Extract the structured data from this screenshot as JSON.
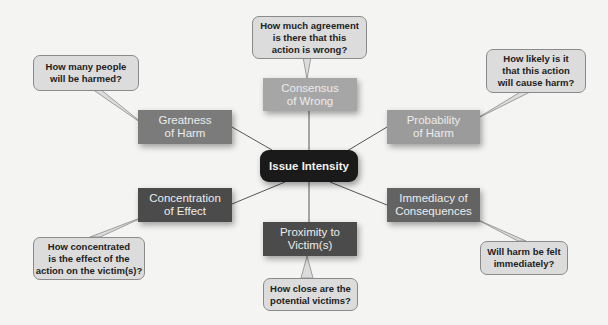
{
  "diagram": {
    "center": {
      "label": "Issue Intensity",
      "color": "#1a1a1a"
    },
    "factors": [
      {
        "id": "consensus",
        "label": "Consensus\nof Wrong",
        "color": "#a6a6a6",
        "question": "How much agreement\nis there that this\naction is wrong?"
      },
      {
        "id": "greatness",
        "label": "Greatness\nof Harm",
        "color": "#7b7b7b",
        "question": "How many people\nwill be harmed?"
      },
      {
        "id": "probability",
        "label": "Probability\nof Harm",
        "color": "#9b9b9b",
        "question": "How likely is it\nthat this action\nwill cause harm?"
      },
      {
        "id": "concentration",
        "label": "Concentration\nof Effect",
        "color": "#4b4b4b",
        "question": "How concentrated\nis the effect of the\naction on the victim(s)?"
      },
      {
        "id": "immediacy",
        "label": "Immediacy of\nConsequences",
        "color": "#636363",
        "question": "Will harm be felt\nimmediately?"
      },
      {
        "id": "proximity",
        "label": "Proximity to\nVictim(s)",
        "color": "#4b4b4b",
        "question": "How close are the\npotential victims?"
      }
    ]
  }
}
